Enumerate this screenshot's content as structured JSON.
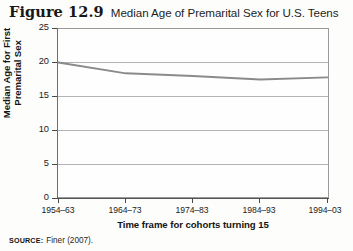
{
  "figure": {
    "number": "Figure 12.9",
    "caption": "Median Age of Premarital Sex for U.S. Teens"
  },
  "source": {
    "key": "SOURCE:",
    "value": "Finer (2007)."
  },
  "chart_data": {
    "type": "line",
    "title": "Median Age of Premarital Sex for U.S. Teens",
    "xlabel": "Time frame for cohorts turning 15",
    "ylabel": "Median Age for First Premarital Sex",
    "ylabel_line1": "Median Age for First",
    "ylabel_line2": "Premarital Sex",
    "categories": [
      "1954–63",
      "1964–73",
      "1974–83",
      "1984–93",
      "1994–03"
    ],
    "values": [
      20.0,
      18.4,
      18.0,
      17.5,
      17.8
    ],
    "ylim": [
      0,
      25
    ],
    "yticks": [
      0,
      5,
      10,
      15,
      20,
      25
    ],
    "ytick_labels": [
      "0",
      "5",
      "10",
      "15",
      "20",
      "25"
    ],
    "grid": true,
    "grid_axis": "y",
    "legend": false,
    "series_color": "#8a8a8a",
    "grid_color": "#b4b4b4",
    "frame_color": "#9a9a9a"
  }
}
